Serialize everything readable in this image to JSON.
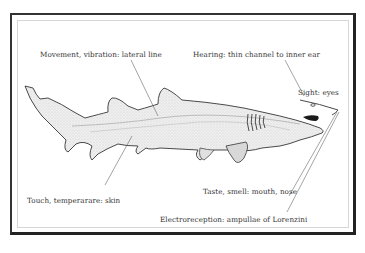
{
  "diagram": {
    "labels": {
      "lateral_line": "Movement, vibration: lateral line",
      "hearing": "Hearing: thin channel to inner ear",
      "sight": "Sight: eyes",
      "touch": "Touch, temperarare: skin",
      "taste_smell": "Taste, smell: mouth, nose",
      "electroreception": "Electroreception: ampullae of Lorenzini"
    },
    "colors": {
      "frame": "#2a2a2a",
      "inner_border": "#d6d6d6",
      "outline": "#4a4a4a",
      "body_fill": "#ebebeb",
      "leader_line": "#666666",
      "text": "#333333"
    }
  }
}
